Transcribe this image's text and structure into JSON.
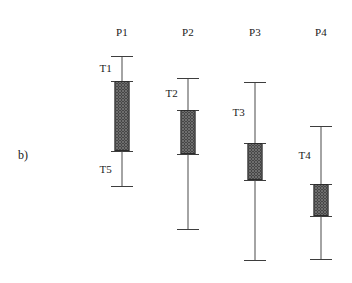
{
  "figure": {
    "panel_label": "b)",
    "panel_label_x": 18,
    "panel_label_y": 148,
    "background_color": "#ffffff",
    "line_color": "#4a4a4a",
    "box_outline_color": "#2b2b2b",
    "box_fill_color": "#6e6e6e",
    "text_color": "#1a1a1a"
  },
  "chart_data": {
    "type": "boxplot",
    "title": "",
    "subtitle": "",
    "xlabel": "",
    "ylabel": "",
    "grid": false,
    "legend": "none",
    "annotations": [
      "b)"
    ],
    "categories": [
      "P1",
      "P2",
      "P3",
      "P4"
    ],
    "category_label_y": 26,
    "boxes": [
      {
        "name": "P1",
        "label": "P1",
        "center_x": 122,
        "box_width": 15,
        "upper_whisker_cap_y": 56,
        "box_top_y": 81,
        "box_bottom_y": 151,
        "lower_whisker_cap_y": 186,
        "bracket_label": "T1",
        "bracket_label_x": 112,
        "bracket_label_y": 68,
        "bracket2_label": "T5",
        "bracket2_label_x": 112,
        "bracket2_label_y": 169
      },
      {
        "name": "P2",
        "label": "P2",
        "center_x": 188,
        "box_width": 15,
        "upper_whisker_cap_y": 78,
        "box_top_y": 110,
        "box_bottom_y": 154,
        "lower_whisker_cap_y": 229,
        "bracket_label": "T2",
        "bracket_label_x": 178,
        "bracket_label_y": 93,
        "bracket2_label": "",
        "bracket2_label_x": 0,
        "bracket2_label_y": 0
      },
      {
        "name": "P3",
        "label": "P3",
        "center_x": 255,
        "box_width": 15,
        "upper_whisker_cap_y": 82,
        "box_top_y": 143,
        "box_bottom_y": 180,
        "lower_whisker_cap_y": 260,
        "bracket_label": "T3",
        "bracket_label_x": 245,
        "bracket_label_y": 112,
        "bracket2_label": "",
        "bracket2_label_x": 0,
        "bracket2_label_y": 0
      },
      {
        "name": "P4",
        "label": "P4",
        "center_x": 321,
        "box_width": 15,
        "upper_whisker_cap_y": 126,
        "box_top_y": 184,
        "box_bottom_y": 216,
        "lower_whisker_cap_y": 259,
        "bracket_label": "T4",
        "bracket_label_x": 311,
        "bracket_label_y": 155,
        "bracket2_label": "",
        "bracket2_label_x": 0,
        "bracket2_label_y": 0
      }
    ],
    "cap_width": 22
  }
}
